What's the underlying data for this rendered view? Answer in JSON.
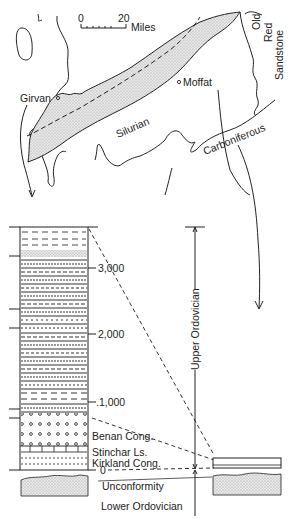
{
  "map": {
    "scale": {
      "start": "0",
      "end": "20",
      "unit": "Miles"
    },
    "places": [
      {
        "name": "Girvan"
      },
      {
        "name": "Moffat"
      }
    ],
    "regions": {
      "silurian": "Silurian",
      "carboniferous": "Carboniferous",
      "old_red_1": "Old",
      "old_red_2": "Red",
      "old_red_3": "Sandstone"
    }
  },
  "column": {
    "thickness_ticks": [
      "3,000",
      "2,000",
      ".1,000",
      "0"
    ],
    "units": [
      "Benan Cong.",
      "Stinchar Ls.",
      "Kirkland Cong."
    ],
    "unconformity": "Unconformity",
    "lower_age": "Lower Ordovician",
    "upper_age": "Upper Ordovician"
  }
}
